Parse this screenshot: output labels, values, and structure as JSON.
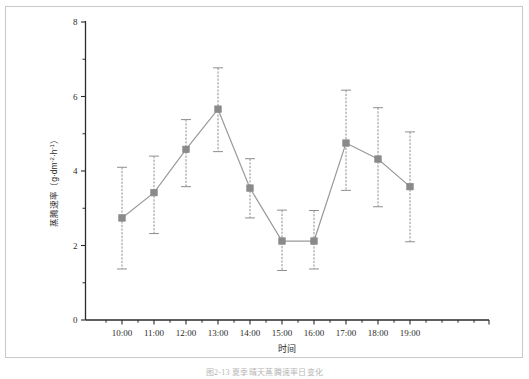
{
  "figure": {
    "caption": "图2-13  夏季晴天蒸腾速率日变化",
    "frame_color": "#c9c9c9",
    "background": "#ffffff"
  },
  "chart_data": {
    "type": "line",
    "title": "",
    "xlabel": "时间",
    "ylabel": "蒸腾速率（g·dm⁻²·h⁻¹）",
    "ylabel_main": "蒸腾速率",
    "ylabel_unit_open": "（g·dm",
    "ylabel_unit_exp1": "-2",
    "ylabel_unit_mid": "·h",
    "ylabel_unit_exp2": "-1",
    "ylabel_unit_close": "）",
    "categories": [
      "10:00",
      "11:00",
      "12:00",
      "13:00",
      "14:00",
      "15:00",
      "16:00",
      "17:00",
      "18:00",
      "19:00"
    ],
    "values": [
      2.74,
      3.42,
      4.58,
      5.66,
      3.54,
      2.12,
      2.12,
      4.75,
      4.32,
      3.58
    ],
    "error_upper": [
      4.1,
      4.4,
      5.38,
      6.77,
      4.33,
      2.95,
      2.94,
      6.17,
      5.7,
      5.05
    ],
    "error_lower": [
      1.37,
      2.32,
      3.58,
      4.52,
      2.74,
      1.33,
      1.37,
      3.48,
      3.04,
      2.1
    ],
    "ylim": [
      0,
      8
    ],
    "yticks": [
      0,
      2,
      4,
      6,
      8
    ],
    "yticks_minor": [
      1,
      3,
      5,
      7
    ],
    "xlim_padding": true,
    "grid": false,
    "legend": false,
    "marker": "square",
    "marker_color": "#8a8a8a",
    "line_color": "#9a9a9a",
    "errorbar_color": "#8f8f8f",
    "axis_color": "#2b2b2b"
  }
}
